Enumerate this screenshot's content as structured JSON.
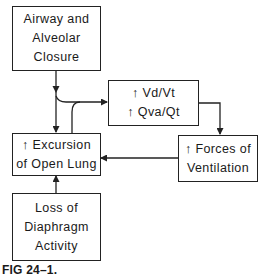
{
  "diagram": {
    "nodes": {
      "airway": {
        "lines": [
          "Airway and",
          "Alveolar",
          "Closure"
        ]
      },
      "ratios": {
        "lines": [
          "↑ Vd/Vt",
          "↑ Qva/Qt"
        ]
      },
      "excursion": {
        "lines": [
          "↑ Excursion",
          "of Open Lung"
        ]
      },
      "forces": {
        "lines": [
          "↑ Forces of",
          "Ventilation"
        ]
      },
      "diaphragm": {
        "lines": [
          "Loss of",
          "Diaphragm",
          "Activity"
        ]
      }
    },
    "edges": [
      {
        "from": "Airway and Alveolar Closure",
        "to": "↑ Vd/Vt ↑ Qva/Qt"
      },
      {
        "from": "Airway and Alveolar Closure",
        "to": "↑ Excursion of Open Lung"
      },
      {
        "from": "↑ Excursion of Open Lung",
        "to": "↑ Vd/Vt ↑ Qva/Qt"
      },
      {
        "from": "↑ Vd/Vt ↑ Qva/Qt",
        "to": "↑ Forces of Ventilation"
      },
      {
        "from": "↑ Forces of Ventilation",
        "to": "↑ Excursion of Open Lung"
      },
      {
        "from": "Loss of Diaphragm Activity",
        "to": "↑ Excursion of Open Lung"
      }
    ]
  },
  "caption": "FIG 24–1."
}
